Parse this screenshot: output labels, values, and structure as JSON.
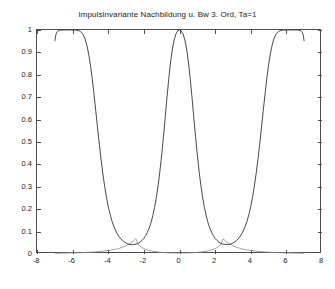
{
  "chart_data": {
    "type": "line",
    "title": "Impulsinvariante Nachbildung u. Bw 3. Ord, Ta=1",
    "xlabel": "",
    "ylabel": "",
    "xlim": [
      -8,
      8
    ],
    "ylim": [
      0,
      1
    ],
    "grid": false,
    "legend": null,
    "xticks": [
      -8,
      -6,
      -4,
      -2,
      0,
      2,
      4,
      6,
      8
    ],
    "xtick_labels": [
      "-8",
      "-6",
      "-4",
      "-2",
      "0",
      "2",
      "4",
      "6",
      "8"
    ],
    "yticks": [
      0,
      0.1,
      0.2,
      0.3,
      0.4,
      0.5,
      0.6,
      0.7,
      0.8,
      0.9,
      1
    ],
    "ytick_labels": [
      "0",
      "0.1",
      "0.2",
      "0.3",
      "0.4",
      "0.5",
      "0.6",
      "0.7",
      "0.8",
      "0.9",
      "1"
    ],
    "series": [
      {
        "name": "Impulsinvariante Nachbildung",
        "color": "#333333",
        "points": [
          [
            -7.0,
            0.95
          ],
          [
            -6.95,
            0.975
          ],
          [
            -6.9,
            0.988
          ],
          [
            -6.85,
            0.994
          ],
          [
            -6.8,
            0.997
          ],
          [
            -6.7,
            0.999
          ],
          [
            -6.6,
            1.0
          ],
          [
            -6.4,
            1.0
          ],
          [
            -6.28,
            1.0
          ],
          [
            -6.1,
            1.0
          ],
          [
            -5.9,
            1.0
          ],
          [
            -5.8,
            0.999
          ],
          [
            -5.7,
            0.998
          ],
          [
            -5.6,
            0.995
          ],
          [
            -5.5,
            0.989
          ],
          [
            -5.4,
            0.978
          ],
          [
            -5.3,
            0.96
          ],
          [
            -5.2,
            0.932
          ],
          [
            -5.1,
            0.893
          ],
          [
            -5.0,
            0.843
          ],
          [
            -4.9,
            0.782
          ],
          [
            -4.8,
            0.713
          ],
          [
            -4.7,
            0.639
          ],
          [
            -4.6,
            0.563
          ],
          [
            -4.5,
            0.489
          ],
          [
            -4.4,
            0.42
          ],
          [
            -4.3,
            0.357
          ],
          [
            -4.2,
            0.301
          ],
          [
            -4.1,
            0.253
          ],
          [
            -4.0,
            0.212
          ],
          [
            -3.9,
            0.178
          ],
          [
            -3.8,
            0.149
          ],
          [
            -3.7,
            0.126
          ],
          [
            -3.6,
            0.107
          ],
          [
            -3.5,
            0.091
          ],
          [
            -3.4,
            0.078
          ],
          [
            -3.3,
            0.068
          ],
          [
            -3.2,
            0.06
          ],
          [
            -3.1,
            0.054
          ],
          [
            -3.0,
            0.049
          ],
          [
            -2.9,
            0.045
          ],
          [
            -2.8,
            0.043
          ],
          [
            -2.7,
            0.042
          ],
          [
            -2.6,
            0.042
          ],
          [
            -2.5,
            0.043
          ],
          [
            -2.4,
            0.045
          ],
          [
            -2.3,
            0.049
          ],
          [
            -2.2,
            0.054
          ],
          [
            -2.1,
            0.061
          ],
          [
            -2.0,
            0.07
          ],
          [
            -1.9,
            0.082
          ],
          [
            -1.8,
            0.097
          ],
          [
            -1.7,
            0.116
          ],
          [
            -1.6,
            0.14
          ],
          [
            -1.5,
            0.17
          ],
          [
            -1.4,
            0.207
          ],
          [
            -1.3,
            0.252
          ],
          [
            -1.2,
            0.306
          ],
          [
            -1.1,
            0.37
          ],
          [
            -1.0,
            0.443
          ],
          [
            -0.9,
            0.525
          ],
          [
            -0.8,
            0.612
          ],
          [
            -0.7,
            0.7
          ],
          [
            -0.6,
            0.784
          ],
          [
            -0.5,
            0.857
          ],
          [
            -0.4,
            0.915
          ],
          [
            -0.3,
            0.956
          ],
          [
            -0.2,
            0.982
          ],
          [
            -0.1,
            0.996
          ],
          [
            0.0,
            1.0
          ],
          [
            0.1,
            0.996
          ],
          [
            0.2,
            0.982
          ],
          [
            0.3,
            0.956
          ],
          [
            0.4,
            0.915
          ],
          [
            0.5,
            0.857
          ],
          [
            0.6,
            0.784
          ],
          [
            0.7,
            0.7
          ],
          [
            0.8,
            0.612
          ],
          [
            0.9,
            0.525
          ],
          [
            1.0,
            0.443
          ],
          [
            1.1,
            0.37
          ],
          [
            1.2,
            0.306
          ],
          [
            1.3,
            0.252
          ],
          [
            1.4,
            0.207
          ],
          [
            1.5,
            0.17
          ],
          [
            1.6,
            0.14
          ],
          [
            1.7,
            0.116
          ],
          [
            1.8,
            0.097
          ],
          [
            1.9,
            0.082
          ],
          [
            2.0,
            0.07
          ],
          [
            2.1,
            0.061
          ],
          [
            2.2,
            0.054
          ],
          [
            2.3,
            0.049
          ],
          [
            2.4,
            0.045
          ],
          [
            2.5,
            0.043
          ],
          [
            2.6,
            0.042
          ],
          [
            2.7,
            0.042
          ],
          [
            2.8,
            0.043
          ],
          [
            2.9,
            0.045
          ],
          [
            3.0,
            0.049
          ],
          [
            3.1,
            0.054
          ],
          [
            3.2,
            0.06
          ],
          [
            3.3,
            0.068
          ],
          [
            3.4,
            0.078
          ],
          [
            3.5,
            0.091
          ],
          [
            3.6,
            0.107
          ],
          [
            3.7,
            0.126
          ],
          [
            3.8,
            0.149
          ],
          [
            3.9,
            0.178
          ],
          [
            4.0,
            0.212
          ],
          [
            4.1,
            0.253
          ],
          [
            4.2,
            0.301
          ],
          [
            4.3,
            0.357
          ],
          [
            4.4,
            0.42
          ],
          [
            4.5,
            0.489
          ],
          [
            4.6,
            0.563
          ],
          [
            4.7,
            0.639
          ],
          [
            4.8,
            0.713
          ],
          [
            4.9,
            0.782
          ],
          [
            5.0,
            0.843
          ],
          [
            5.1,
            0.893
          ],
          [
            5.2,
            0.932
          ],
          [
            5.3,
            0.96
          ],
          [
            5.4,
            0.978
          ],
          [
            5.5,
            0.989
          ],
          [
            5.6,
            0.995
          ],
          [
            5.7,
            0.998
          ],
          [
            5.8,
            0.999
          ],
          [
            5.9,
            1.0
          ],
          [
            6.1,
            1.0
          ],
          [
            6.28,
            1.0
          ],
          [
            6.4,
            1.0
          ],
          [
            6.6,
            1.0
          ],
          [
            6.7,
            0.999
          ],
          [
            6.8,
            0.997
          ],
          [
            6.85,
            0.994
          ],
          [
            6.9,
            0.988
          ],
          [
            6.95,
            0.975
          ],
          [
            7.0,
            0.95
          ]
        ]
      },
      {
        "name": "Butterworth 3. Ordnung (analog)",
        "color": "#8c8c8c",
        "points": [
          [
            -7.0,
            0.003
          ],
          [
            -6.5,
            0.004
          ],
          [
            -6.0,
            0.005
          ],
          [
            -5.5,
            0.006
          ],
          [
            -5.0,
            0.008
          ],
          [
            -4.5,
            0.011
          ],
          [
            -4.0,
            0.016
          ],
          [
            -3.8,
            0.018
          ],
          [
            -3.6,
            0.021
          ],
          [
            -3.4,
            0.025
          ],
          [
            -3.2,
            0.03
          ],
          [
            -3.0,
            0.037
          ],
          [
            -2.8,
            0.045
          ],
          [
            -2.6,
            0.057
          ],
          [
            -2.45,
            0.068
          ],
          [
            -2.3,
            0.04
          ],
          [
            -2.1,
            0.028
          ],
          [
            -1.9,
            0.021
          ],
          [
            -1.6,
            0.014
          ],
          [
            -1.3,
            0.01
          ],
          [
            -1.0,
            0.007
          ],
          [
            -0.6,
            0.005
          ],
          [
            0.0,
            0.004
          ],
          [
            0.6,
            0.005
          ],
          [
            1.0,
            0.007
          ],
          [
            1.3,
            0.01
          ],
          [
            1.6,
            0.014
          ],
          [
            1.9,
            0.021
          ],
          [
            2.1,
            0.028
          ],
          [
            2.3,
            0.04
          ],
          [
            2.45,
            0.068
          ],
          [
            2.6,
            0.057
          ],
          [
            2.8,
            0.045
          ],
          [
            3.0,
            0.037
          ],
          [
            3.2,
            0.03
          ],
          [
            3.4,
            0.025
          ],
          [
            3.6,
            0.021
          ],
          [
            3.8,
            0.018
          ],
          [
            4.0,
            0.016
          ],
          [
            4.5,
            0.011
          ],
          [
            5.0,
            0.008
          ],
          [
            5.5,
            0.006
          ],
          [
            6.0,
            0.005
          ],
          [
            6.5,
            0.004
          ],
          [
            7.0,
            0.003
          ]
        ]
      }
    ]
  },
  "figure": {
    "background_color": "#ffffff",
    "axis_color": "#4d4d4d",
    "text_color": "#1a1a1a"
  }
}
